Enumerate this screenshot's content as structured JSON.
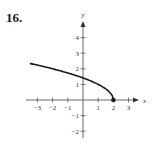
{
  "problem": {
    "number": "16."
  },
  "chart_data": {
    "type": "line",
    "title": "",
    "xlabel": "x",
    "ylabel": "y",
    "xlim": [
      -3.5,
      3.5
    ],
    "ylim": [
      -2.5,
      4.8
    ],
    "x_ticks": [
      -3,
      -2,
      -1,
      1,
      2,
      3
    ],
    "y_ticks": [
      -2,
      -1,
      1,
      2,
      3,
      4
    ],
    "x_tick_labels": [
      "−3",
      "−2",
      "−1",
      "1",
      "2",
      "3"
    ],
    "y_tick_labels": [
      "−2",
      "−1",
      "1",
      "2",
      "3",
      "4"
    ],
    "grid": false,
    "legend": null,
    "series": [
      {
        "name": "y = sqrt(2 - x)",
        "x": [
          -3.5,
          -3,
          -2,
          -1,
          0,
          1,
          1.5,
          1.8,
          2
        ],
        "y": [
          2.35,
          2.24,
          2.0,
          1.73,
          1.41,
          1.0,
          0.71,
          0.45,
          0
        ],
        "color": "#1a1a1a",
        "endpoint": {
          "x": 2,
          "y": 0,
          "style": "filled-dot"
        }
      }
    ]
  }
}
